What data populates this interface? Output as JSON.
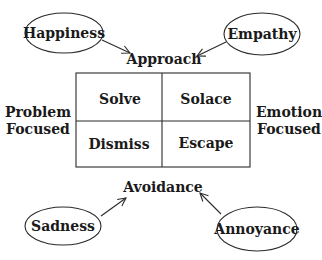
{
  "diagram": {
    "type": "coping-strategies-2x2",
    "top_label": "Approach",
    "bottom_label": "Avoidance",
    "left_label": [
      "Problem",
      "Focused"
    ],
    "right_label": [
      "Emotion",
      "Focused"
    ],
    "grid": {
      "cells": [
        {
          "row": 0,
          "col": 0,
          "label": "Solve"
        },
        {
          "row": 0,
          "col": 1,
          "label": "Solace"
        },
        {
          "row": 1,
          "col": 0,
          "label": "Dismiss"
        },
        {
          "row": 1,
          "col": 1,
          "label": "Escape"
        }
      ]
    },
    "emotions": [
      {
        "label": "Happiness",
        "points_to": "Approach"
      },
      {
        "label": "Empathy",
        "points_to": "Approach"
      },
      {
        "label": "Sadness",
        "points_to": "Avoidance"
      },
      {
        "label": "Annoyance",
        "points_to": "Avoidance"
      }
    ],
    "colors": {
      "stroke": "#2a2a2a",
      "text": "#1a1a1a",
      "background": "#ffffff"
    }
  }
}
